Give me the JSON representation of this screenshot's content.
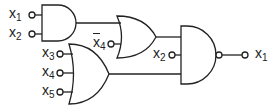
{
  "diagram": {
    "type": "logic-circuit",
    "stroke_color": "#222222",
    "gates": [
      {
        "id": "g1",
        "type": "AND",
        "inputs": [
          "x1",
          "x2"
        ],
        "output_to": "g2"
      },
      {
        "id": "g2",
        "type": "OR",
        "inputs": [
          "g1",
          "x4_bar"
        ],
        "output_to": "g4"
      },
      {
        "id": "g3",
        "type": "OR",
        "inputs": [
          "x3",
          "x4",
          "x5"
        ],
        "output_to": "g4"
      },
      {
        "id": "g4",
        "type": "NAND",
        "inputs": [
          "g2",
          "x2",
          "g3"
        ],
        "output": "x1"
      }
    ],
    "labels": {
      "in_x1": {
        "base": "x",
        "sub": "1"
      },
      "in_x2": {
        "base": "x",
        "sub": "2"
      },
      "in_x4bar": {
        "base": "x",
        "sub": "4"
      },
      "in_x3": {
        "base": "x",
        "sub": "3"
      },
      "in_x4": {
        "base": "x",
        "sub": "4"
      },
      "in_x5": {
        "base": "x",
        "sub": "5"
      },
      "in_x2b": {
        "base": "x",
        "sub": "2"
      },
      "out_x1": {
        "base": "x",
        "sub": "1"
      }
    }
  }
}
